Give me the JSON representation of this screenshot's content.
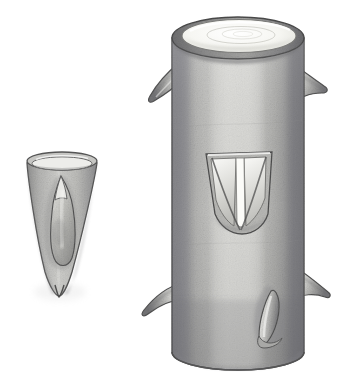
{
  "figure": {
    "background_color": "#ffffff",
    "width": 356,
    "height": 375,
    "medium": "graphite / wash drawing",
    "caption": "Two shaded specimens: a small conical sclerite with an inner teardrop body at left, and a large spined cylindrical tube with a V-shaped notch at right.",
    "palette": {
      "paper": "#ffffff",
      "outline": "#4a4a4a",
      "outline_dark": "#3a3a3a",
      "body_light": "#d8d8d6",
      "body_mid": "#b4b4b2",
      "body_dark": "#8f8f8e",
      "body_shadow": "#76767a",
      "highlight": "#f2f2f0",
      "rim_dark": "#6e6e70",
      "cut_surface": "#f6f6f2",
      "spine_light": "#e4e4e1",
      "spine_shade": "#9a9a99"
    }
  },
  "specimens": [
    {
      "id": "small-conical-specimen",
      "label": "Small conical specimen",
      "position": "left",
      "bounds": {
        "x": 22,
        "y": 150,
        "width": 76,
        "height": 148
      },
      "description": "Cone tapering to a sharp apex at the bottom, open elliptical rim at the top, containing a single embedded teardrop-shaped inner body.",
      "parts": [
        {
          "name": "conical-wall",
          "label": "Conical wall"
        },
        {
          "name": "open-rim",
          "label": "Open elliptical rim"
        },
        {
          "name": "inner-teardrop-body",
          "label": "Inner teardrop body"
        },
        {
          "name": "apex-point",
          "label": "Apex point"
        }
      ]
    },
    {
      "id": "large-cylindrical-specimen",
      "label": "Large cylindrical specimen",
      "position": "right",
      "bounds": {
        "x": 148,
        "y": 10,
        "width": 200,
        "height": 365
      },
      "description": "Upright hollow cylinder with a pale elliptical cut surface on top, cylindrical tonal shading, a central V-shaped notch, and five projecting spines around its circumference. The base is cropped by the frame edge.",
      "parts": [
        {
          "name": "cylinder-body",
          "label": "Cylinder body"
        },
        {
          "name": "top-cut-surface",
          "label": "Top cut surface"
        },
        {
          "name": "top-rim",
          "label": "Top rim"
        },
        {
          "name": "v-notch",
          "label": "V-shaped notch"
        },
        {
          "name": "base-edge",
          "label": "Cropped base edge"
        }
      ],
      "spines": [
        {
          "name": "spine-upper-left",
          "label": "Upper left spine",
          "direction": "down-left"
        },
        {
          "name": "spine-upper-right",
          "label": "Upper right spine",
          "direction": "right"
        },
        {
          "name": "spine-lower-left",
          "label": "Lower left spine",
          "direction": "down-left hooked"
        },
        {
          "name": "spine-lower-right",
          "label": "Lower right spine",
          "direction": "right"
        },
        {
          "name": "spine-front-lower",
          "label": "Front lower spine",
          "direction": "forward"
        }
      ]
    }
  ]
}
